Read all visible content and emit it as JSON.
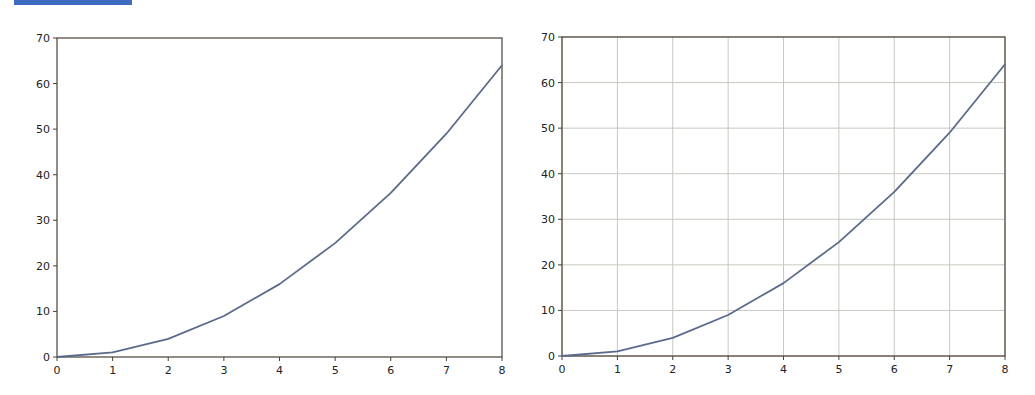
{
  "header": {
    "color": "#3f6bbf"
  },
  "chart_data": [
    {
      "type": "line",
      "title": "",
      "xlabel": "",
      "ylabel": "",
      "x": [
        0,
        1,
        2,
        3,
        4,
        5,
        6,
        7,
        8
      ],
      "series": [
        {
          "name": "y = x^2",
          "values": [
            0,
            1,
            4,
            9,
            16,
            25,
            36,
            49,
            64
          ],
          "color": "#5a6a8a"
        }
      ],
      "xlim": [
        0,
        8
      ],
      "ylim": [
        0,
        70
      ],
      "xticks": [
        "0",
        "1",
        "2",
        "3",
        "4",
        "5",
        "6",
        "7",
        "8"
      ],
      "yticks": [
        "0",
        "10",
        "20",
        "30",
        "40",
        "50",
        "60",
        "70"
      ],
      "grid": false,
      "legend": null
    },
    {
      "type": "line",
      "title": "",
      "xlabel": "",
      "ylabel": "",
      "x": [
        0,
        1,
        2,
        3,
        4,
        5,
        6,
        7,
        8
      ],
      "series": [
        {
          "name": "y = x^2",
          "values": [
            0,
            1,
            4,
            9,
            16,
            25,
            36,
            49,
            64
          ],
          "color": "#5a6a8a"
        }
      ],
      "xlim": [
        0,
        8
      ],
      "ylim": [
        0,
        70
      ],
      "xticks": [
        "0",
        "1",
        "2",
        "3",
        "4",
        "5",
        "6",
        "7",
        "8"
      ],
      "yticks": [
        "0",
        "10",
        "20",
        "30",
        "40",
        "50",
        "60",
        "70"
      ],
      "grid": true,
      "legend": null
    }
  ],
  "layout": [
    {
      "left": 57,
      "right": 502,
      "top": 38,
      "bottom": 357
    },
    {
      "left": 562,
      "right": 1005,
      "top": 37,
      "bottom": 356
    }
  ]
}
